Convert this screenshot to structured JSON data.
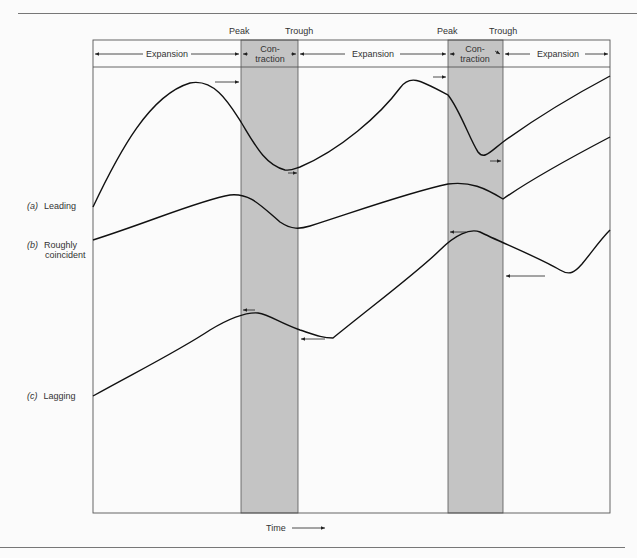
{
  "diagram": {
    "title": "",
    "phase_markers": [
      {
        "label": "Peak",
        "x": 240
      },
      {
        "label": "Trough",
        "x": 298
      },
      {
        "label": "Peak",
        "x": 448
      },
      {
        "label": "Trough",
        "x": 503
      }
    ],
    "phases": [
      {
        "label": "Expansion",
        "type": "expansion"
      },
      {
        "label": "Con-\ntraction",
        "line1": "Con-",
        "line2": "traction",
        "type": "contraction"
      },
      {
        "label": "Expansion",
        "type": "expansion"
      },
      {
        "label": "Con-\ntraction",
        "line1": "Con-",
        "line2": "traction",
        "type": "contraction"
      },
      {
        "label": "Expansion",
        "type": "expansion"
      }
    ],
    "series_labels": [
      {
        "tag": "(a)",
        "name": "Leading"
      },
      {
        "tag": "(b)",
        "name": "Roughly",
        "name2": "coincident"
      },
      {
        "tag": "(c)",
        "name": "Lagging"
      }
    ],
    "x_axis_label": "Time",
    "colors": {
      "contraction_shade": "#c4c4c4",
      "line": "#111111",
      "frame": "#555555"
    }
  }
}
